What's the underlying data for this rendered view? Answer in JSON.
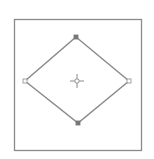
{
  "canvas": {
    "width": 154,
    "height": 159,
    "background": "#ffffff"
  },
  "frame": {
    "x": 14,
    "y": 19,
    "width": 127,
    "height": 131,
    "stroke": "#8a8a8a"
  },
  "diamond": {
    "stroke": "#8a8a8a",
    "vertices": {
      "top": [
        76,
        37
      ],
      "right": [
        129,
        81
      ],
      "bottom": [
        78,
        123
      ],
      "left": [
        25,
        81
      ]
    }
  },
  "center_marker": {
    "x": 77,
    "y": 81,
    "icon": "crosshair-icon",
    "color": "#8a8a8a"
  }
}
